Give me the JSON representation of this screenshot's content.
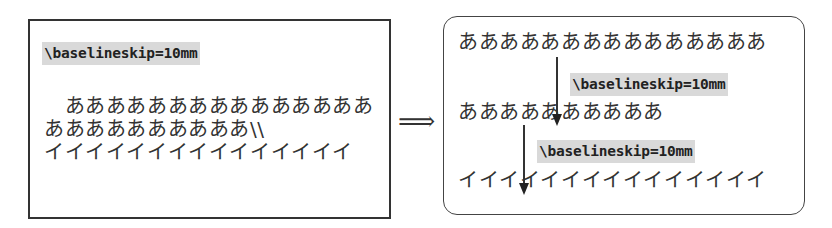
{
  "left_panel": {
    "command": "\\baselineskip=10mm",
    "lines": [
      "　あああああああああああああああ",
      "ああああああああああ\\\\",
      "イイイイイイイイイイイイイイイ"
    ]
  },
  "implies_symbol": "⟹",
  "right_panel": {
    "lines": [
      "あああああああああああああああ",
      "ああああああああああ",
      "イイイイイイイイイイイイイイイ"
    ],
    "annotations": [
      {
        "label": "\\baselineskip=10mm",
        "from_line": 1,
        "to_line": 2
      },
      {
        "label": "\\baselineskip=10mm",
        "from_line": 2,
        "to_line": 3
      }
    ]
  }
}
